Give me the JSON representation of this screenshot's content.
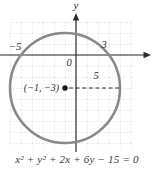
{
  "figure": {
    "type": "circle-on-coordinate-grid",
    "equation": "x² + y² + 2x + 6y − 15 = 0",
    "axis": {
      "y_label": "y",
      "origin_label": "0"
    },
    "labels": {
      "x_intercept_left": "−5",
      "x_intercept_right": "3",
      "center_point": "(−1, −3)",
      "radius_length": "5"
    },
    "geometry": {
      "circle_center": [
        -1,
        -3
      ],
      "circle_radius": 5,
      "x_intercepts": [
        -5,
        3
      ]
    },
    "colors": {
      "circle_stroke": "#8a8a8a",
      "axis": "#2b2b2b",
      "grid": "#c9c9c9",
      "dot": "#161616",
      "text": "#2e2e2e"
    }
  }
}
